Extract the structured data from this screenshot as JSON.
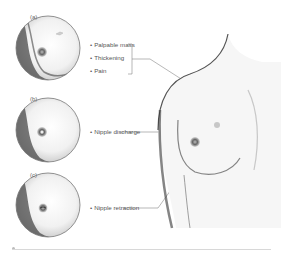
{
  "figure": {
    "panels": [
      {
        "id": "a",
        "label": "(a)",
        "symptoms": [
          "Palpable mass",
          "Thickening",
          "Pain"
        ]
      },
      {
        "id": "b",
        "label": "(b)",
        "symptoms": [
          "Nipple discharge"
        ]
      },
      {
        "id": "c",
        "label": "(c)",
        "symptoms": [
          "Nipple retraction"
        ]
      }
    ],
    "colors": {
      "background": "#ffffff",
      "line": "#888888",
      "shade_dark": "#3a3a3a",
      "text": "#555555"
    }
  }
}
